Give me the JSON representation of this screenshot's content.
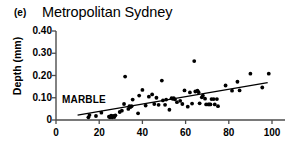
{
  "panel": {
    "label": "(e)",
    "title": "Metropolitan Sydney"
  },
  "axes": {
    "ylabel": "Depth (mm)",
    "xlabel": "",
    "yticks": [
      "0",
      "0.10",
      "0.20",
      "0.30",
      "0.40"
    ],
    "xticks": [
      "0",
      "20",
      "40",
      "60",
      "80",
      "100"
    ]
  },
  "annotations": {
    "series_label": "MARBLE"
  },
  "colors": {
    "marker": "#000000",
    "axis": "#4d4d4d",
    "trendline": "#000000",
    "background": "#ffffff"
  },
  "chart_data": {
    "type": "scatter",
    "title": "Metropolitan Sydney",
    "panel_label": "(e)",
    "xlabel": "",
    "ylabel": "Depth (mm)",
    "xlim": [
      0,
      103
    ],
    "ylim": [
      0,
      0.4
    ],
    "xticks": [
      0,
      20,
      40,
      60,
      80,
      100
    ],
    "yticks": [
      0,
      0.1,
      0.2,
      0.3,
      0.4
    ],
    "grid": false,
    "legend": null,
    "series": [
      {
        "name": "MARBLE",
        "marker": "circle",
        "color": "#000000",
        "points": [
          [
            15.0,
            0.012
          ],
          [
            15.5,
            0.022
          ],
          [
            18.5,
            0.018
          ],
          [
            21.0,
            0.033
          ],
          [
            24.5,
            0.015
          ],
          [
            25.0,
            0.012
          ],
          [
            25.5,
            0.02
          ],
          [
            26.0,
            0.012
          ],
          [
            26.5,
            0.018
          ],
          [
            27.0,
            0.013
          ],
          [
            27.5,
            0.021
          ],
          [
            29.5,
            0.036
          ],
          [
            30.5,
            0.042
          ],
          [
            31.5,
            0.072
          ],
          [
            32.0,
            0.195
          ],
          [
            33.5,
            0.05
          ],
          [
            34.0,
            0.062
          ],
          [
            34.5,
            0.058
          ],
          [
            35.0,
            0.062
          ],
          [
            35.5,
            0.092
          ],
          [
            38.0,
            0.03
          ],
          [
            38.5,
            0.11
          ],
          [
            40.0,
            0.135
          ],
          [
            41.5,
            0.065
          ],
          [
            43.0,
            0.105
          ],
          [
            44.5,
            0.115
          ],
          [
            45.5,
            0.072
          ],
          [
            46.5,
            0.1
          ],
          [
            47.5,
            0.068
          ],
          [
            49.0,
            0.177
          ],
          [
            49.5,
            0.088
          ],
          [
            50.5,
            0.068
          ],
          [
            51.0,
            0.092
          ],
          [
            52.5,
            0.046
          ],
          [
            53.5,
            0.098
          ],
          [
            54.0,
            0.095
          ],
          [
            54.5,
            0.098
          ],
          [
            55.0,
            0.093
          ],
          [
            56.0,
            0.08
          ],
          [
            57.5,
            0.086
          ],
          [
            58.5,
            0.072
          ],
          [
            59.5,
            0.133
          ],
          [
            61.0,
            0.06
          ],
          [
            62.0,
            0.124
          ],
          [
            63.0,
            0.074
          ],
          [
            64.0,
            0.265
          ],
          [
            64.5,
            0.128
          ],
          [
            65.5,
            0.132
          ],
          [
            66.0,
            0.125
          ],
          [
            66.5,
            0.075
          ],
          [
            67.5,
            0.102
          ],
          [
            68.0,
            0.11
          ],
          [
            69.0,
            0.096
          ],
          [
            69.5,
            0.07
          ],
          [
            70.5,
            0.07
          ],
          [
            71.0,
            0.07
          ],
          [
            71.5,
            0.07
          ],
          [
            72.0,
            0.094
          ],
          [
            73.0,
            0.094
          ],
          [
            73.5,
            0.07
          ],
          [
            74.5,
            0.094
          ],
          [
            75.0,
            0.062
          ],
          [
            78.5,
            0.155
          ],
          [
            81.5,
            0.132
          ],
          [
            84.0,
            0.172
          ],
          [
            85.0,
            0.133
          ],
          [
            90.0,
            0.208
          ],
          [
            95.5,
            0.146
          ],
          [
            98.5,
            0.208
          ]
        ]
      }
    ],
    "trendline": {
      "x": [
        10.0,
        98.0
      ],
      "y": [
        0.022,
        0.168
      ]
    }
  }
}
